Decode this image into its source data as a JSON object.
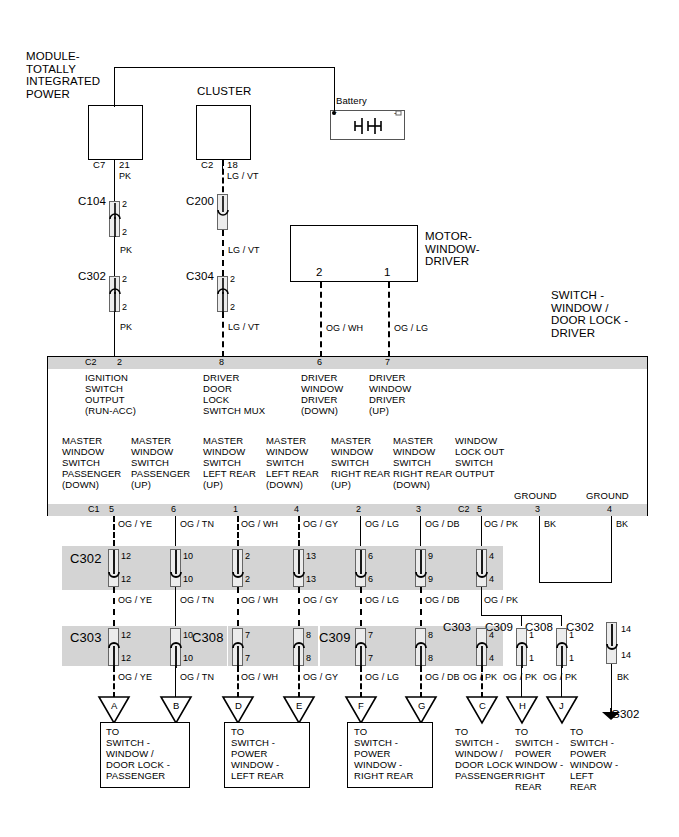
{
  "diagram": {
    "colors": {
      "wire": "#000000",
      "band": "#d4d4d4",
      "box_fill": "#ffffff"
    }
  },
  "top_modules": [
    {
      "name": "module-totally-integrated-power",
      "label": "MODULE-\nTOTALLY\nINTEGRATED\nPOWER",
      "connector": "C7",
      "pin": "21",
      "wire": "PK"
    },
    {
      "name": "cluster",
      "label": "CLUSTER",
      "connector": "C2",
      "pin": "18",
      "wire": "LG / VT"
    },
    {
      "name": "battery",
      "label": "Battery",
      "plus": "+",
      "minus": "-"
    },
    {
      "name": "motor-window-driver",
      "label": "MOTOR-\nWINDOW-\nDRIVER",
      "pin_left": "2",
      "pin_right": "1",
      "wire_left": "OG / WH",
      "wire_right": "OG / LG"
    }
  ],
  "switch_block": {
    "title": "SWITCH -\nWINDOW /\nDOOR LOCK -\nDRIVER"
  },
  "upper_inline_connectors": [
    {
      "name": "C104",
      "label": "C104",
      "pin_top": "2",
      "pin_bottom": "2",
      "wire_above": "PK",
      "wire_below": "PK"
    },
    {
      "name": "C200",
      "label": "C200",
      "pin_top": "2",
      "pin_bottom": "2",
      "wire_above": "LG / VT",
      "wire_below": "LG / VT"
    },
    {
      "name": "C302",
      "label": "C302",
      "pin_top": "2",
      "pin_bottom": "2",
      "wire_above": "PK",
      "wire_below": "PK"
    },
    {
      "name": "C304",
      "label": "C304",
      "pin_top": "2",
      "pin_bottom": "2",
      "wire_above": "LG / VT",
      "wire_below": "LG / VT"
    }
  ],
  "top_pins": [
    {
      "connector": "C2",
      "pin": "2",
      "desc": "IGNITION\nSWITCH\nOUTPUT\n(RUN-ACC)"
    },
    {
      "connector": "",
      "pin": "8",
      "desc": "DRIVER\nDOOR\nLOCK\nSWITCH MUX"
    },
    {
      "connector": "",
      "pin": "6",
      "desc": "DRIVER\nWINDOW\nDRIVER\n(DOWN)"
    },
    {
      "connector": "",
      "pin": "7",
      "desc": "DRIVER\nWINDOW\nDRIVER\n(UP)"
    }
  ],
  "bottom_pins": [
    {
      "connector": "C1",
      "pin": "5",
      "desc": "MASTER\nWINDOW\nSWITCH\nPASSENGER\n(DOWN)",
      "wire": "OG / YE"
    },
    {
      "connector": "",
      "pin": "6",
      "desc": "MASTER\nWINDOW\nSWITCH\nPASSENGER\n(UP)",
      "wire": "OG / TN"
    },
    {
      "connector": "",
      "pin": "1",
      "desc": "MASTER\nWINDOW\nSWITCH\nLEFT REAR\n(UP)",
      "wire": "OG / WH"
    },
    {
      "connector": "",
      "pin": "4",
      "desc": "MASTER\nWINDOW\nSWITCH\nLEFT REAR\n(DOWN)",
      "wire": "OG / GY"
    },
    {
      "connector": "",
      "pin": "2",
      "desc": "MASTER\nWINDOW\nSWITCH\nRIGHT REAR\n(UP)",
      "wire": "OG / LG"
    },
    {
      "connector": "",
      "pin": "3",
      "desc": "MASTER\nWINDOW\nSWITCH\nRIGHT REAR\n(DOWN)",
      "wire": "OG / DB"
    },
    {
      "connector": "C2",
      "pin": "5",
      "desc": "WINDOW\nLOCK OUT\nSWITCH\nOUTPUT",
      "wire": "OG / PK"
    },
    {
      "connector": "",
      "pin": "3",
      "desc": "GROUND",
      "wire": "BK"
    },
    {
      "connector": "",
      "pin": "4",
      "desc": "GROUND",
      "wire": "BK"
    }
  ],
  "row1": {
    "label": "C302",
    "cells": [
      {
        "pin_top": "12",
        "pin_bottom": "12",
        "wire_above": "OG / YE",
        "wire_below": "OG / YE"
      },
      {
        "pin_top": "10",
        "pin_bottom": "10",
        "wire_above": "OG / TN",
        "wire_below": "OG / TN"
      },
      {
        "pin_top": "2",
        "pin_bottom": "2",
        "wire_above": "OG / WH",
        "wire_below": "OG / WH"
      },
      {
        "pin_top": "13",
        "pin_bottom": "13",
        "wire_above": "OG / GY",
        "wire_below": "OG / GY"
      },
      {
        "pin_top": "6",
        "pin_bottom": "6",
        "wire_above": "OG / LG",
        "wire_below": "OG / LG"
      },
      {
        "pin_top": "9",
        "pin_bottom": "9",
        "wire_above": "OG / DB",
        "wire_below": "OG / DB"
      },
      {
        "pin_top": "4",
        "pin_bottom": "4",
        "wire_above": "OG / PK",
        "wire_below": "OG / PK"
      }
    ]
  },
  "row2": {
    "labels": [
      "C303",
      "C308",
      "C309"
    ],
    "cells": [
      {
        "pin_top": "12",
        "pin_bottom": "12",
        "wire_below": "OG / YE"
      },
      {
        "pin_top": "10",
        "pin_bottom": "10",
        "wire_below": "OG / TN"
      },
      {
        "pin_top": "7",
        "pin_bottom": "7",
        "wire_below": "OG / WH"
      },
      {
        "pin_top": "8",
        "pin_bottom": "8",
        "wire_below": "OG / GY"
      },
      {
        "pin_top": "7",
        "pin_bottom": "7",
        "wire_below": "OG / LG"
      },
      {
        "pin_top": "8",
        "pin_bottom": "8",
        "wire_below": "OG / DB"
      }
    ]
  },
  "row2_right": {
    "labels": [
      "C303",
      "C309",
      "C308",
      "C302"
    ],
    "cells": [
      {
        "pin_top": "4",
        "pin_bottom": "4",
        "wire_below": "OG / PK"
      },
      {
        "pin_top": "1",
        "pin_bottom": "1",
        "wire_below": "OG / PK"
      },
      {
        "pin_top": "1",
        "pin_bottom": "1",
        "wire_below": "OG / PK"
      },
      {
        "pin_top": "14",
        "pin_bottom": "14",
        "wire_below": "BK"
      }
    ]
  },
  "ground": {
    "label": "G302"
  },
  "destinations": [
    {
      "tag": "A",
      "boxed": true,
      "text": "TO\nSWITCH -\nWINDOW /\nDOOR LOCK -\nPASSENGER"
    },
    {
      "tag": "B",
      "boxed": true,
      "text": ""
    },
    {
      "tag": "D",
      "boxed": true,
      "text": "TO\nSWITCH -\nPOWER\nWINDOW -\nLEFT REAR"
    },
    {
      "tag": "E",
      "boxed": true,
      "text": ""
    },
    {
      "tag": "F",
      "boxed": true,
      "text": "TO\nSWITCH -\nPOWER\nWINDOW -\nRIGHT REAR"
    },
    {
      "tag": "G",
      "boxed": true,
      "text": ""
    },
    {
      "tag": "C",
      "boxed": false,
      "text": "TO\nSWITCH -\nWINDOW /\nDOOR LOCK -\nPASSENGER"
    },
    {
      "tag": "H",
      "boxed": false,
      "text": "TO\nSWITCH -\nPOWER\nWINDOW -\nRIGHT\nREAR"
    },
    {
      "tag": "J",
      "boxed": false,
      "text": "TO\nSWITCH -\nPOWER\nWINDOW -\nLEFT\nREAR"
    }
  ]
}
